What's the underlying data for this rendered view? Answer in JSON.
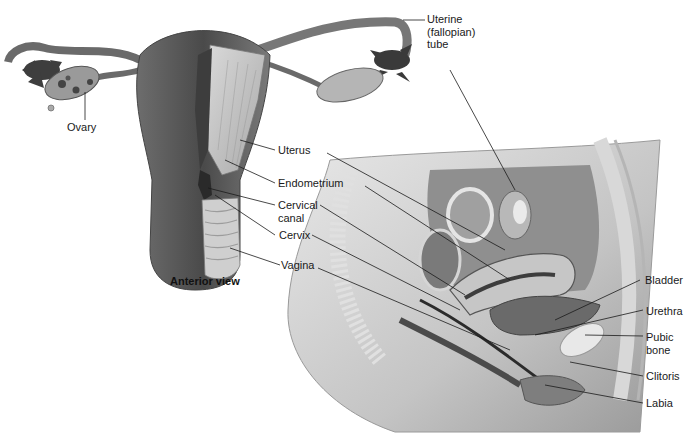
{
  "diagram": {
    "caption": "Anterior view",
    "labels": {
      "uterine_tube_1": "Uterine",
      "uterine_tube_2": "(fallopian)",
      "uterine_tube_3": "tube",
      "ovary": "Ovary",
      "uterus": "Uterus",
      "endometrium": "Endometrium",
      "cervical_canal_1": "Cervical",
      "cervical_canal_2": "canal",
      "cervix": "Cervix",
      "vagina": "Vagina",
      "bladder": "Bladder",
      "urethra": "Urethra",
      "pubic_bone_1": "Pubic",
      "pubic_bone_2": "bone",
      "clitoris": "Clitoris",
      "labia": "Labia"
    },
    "colors": {
      "tissue_dark": "#5a5a5a",
      "tissue_mid": "#8c8c8c",
      "tissue_light": "#c8c8c8",
      "leader_line": "#1a1a1a",
      "background": "#ffffff"
    }
  }
}
